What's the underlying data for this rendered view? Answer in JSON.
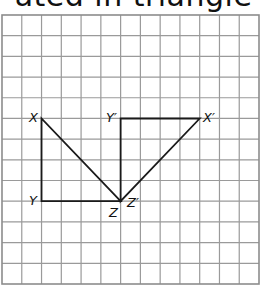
{
  "header": {
    "title_fragment": "ated in triangle"
  },
  "grid": {
    "columns": 13,
    "rows": 13,
    "origin_x": 2,
    "origin_y": 15,
    "cell_w": 19.77,
    "cell_h": 20.69,
    "line_color": "#9a9a9a"
  },
  "triangles": [
    {
      "name": "XYZ",
      "vertices": [
        {
          "label": "X",
          "col": 2,
          "row": 5
        },
        {
          "label": "Y",
          "col": 2,
          "row": 9
        },
        {
          "label": "Z",
          "col": 6,
          "row": 9
        }
      ]
    },
    {
      "name": "X'Y'Z'",
      "vertices": [
        {
          "label": "X′",
          "col": 10,
          "row": 5
        },
        {
          "label": "Y′",
          "col": 6,
          "row": 5
        },
        {
          "label": "Z′",
          "col": 6,
          "row": 9
        }
      ]
    }
  ],
  "labels": {
    "X": "X",
    "Y": "Y",
    "Z": "Z",
    "Xp": "X′",
    "Yp": "Y′",
    "Zp": "Z′"
  },
  "colors": {
    "shape_stroke": "#1a1a1a",
    "background": "#ffffff"
  }
}
